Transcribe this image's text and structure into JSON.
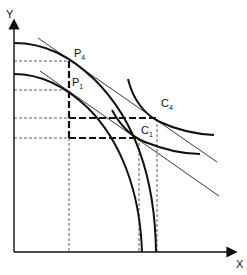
{
  "diagram": {
    "type": "economics-ppf-indifference",
    "axes": {
      "x_label": "X",
      "y_label": "Y"
    },
    "curves": [
      {
        "id": "ppf-outer",
        "kind": "production-possibility-frontier",
        "tangent_point": "P4"
      },
      {
        "id": "ppf-inner",
        "kind": "production-possibility-frontier",
        "tangent_point": "P1"
      },
      {
        "id": "ic-c4",
        "kind": "indifference-curve",
        "tangent_point": "C4"
      },
      {
        "id": "ic-c1",
        "kind": "indifference-curve",
        "tangent_point": "C1"
      }
    ],
    "points": {
      "p4": {
        "letter": "P",
        "sub": "4"
      },
      "p1": {
        "letter": "P",
        "sub": "1"
      },
      "c4": {
        "letter": "C",
        "sub": "4"
      },
      "c1": {
        "letter": "C",
        "sub": "1"
      }
    },
    "colors": {
      "line": "#111111",
      "background": "#ffffff"
    }
  }
}
